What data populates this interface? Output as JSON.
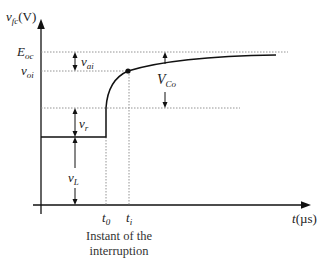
{
  "diagram": {
    "type": "voltage-vs-time",
    "y_axis": {
      "symbol": "v",
      "subscript": "fc",
      "unit": "(V)"
    },
    "x_axis": {
      "symbol": "t",
      "unit": "(µs)"
    },
    "levels": {
      "E_oc": {
        "symbol": "E",
        "subscript": "oc"
      },
      "v_oi": {
        "symbol": "v",
        "subscript": "oi"
      }
    },
    "arrows": {
      "v_ai": {
        "symbol": "v",
        "subscript": "ai"
      },
      "V_Co": {
        "symbol": "V",
        "subscript": "Co"
      },
      "v_r": {
        "symbol": "v",
        "subscript": "r"
      },
      "v_L": {
        "symbol": "v",
        "subscript": "L"
      }
    },
    "time_marks": {
      "t0": {
        "symbol": "t",
        "subscript": "0"
      },
      "ti": {
        "symbol": "t",
        "subscript": "i"
      }
    },
    "caption": {
      "line1": "Instant of the",
      "line2": "interruption"
    }
  }
}
